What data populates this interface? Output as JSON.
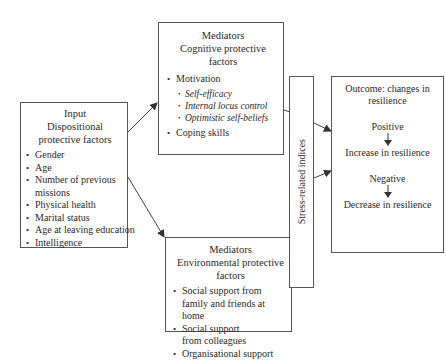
{
  "input": {
    "heading": "Input",
    "subheading": "Dispositional protective factors",
    "items": [
      "Gender",
      "Age",
      "Number of previous missions",
      "Physical health",
      "Marital status",
      "Age at leaving education",
      "Intelligence"
    ]
  },
  "cognitive": {
    "heading": "Mediators",
    "subheading": "Cognitive protective factors",
    "items": [
      "Motivation",
      "Coping skills"
    ],
    "motivation_subitems": [
      "Self-efficacy",
      "Internal locus control",
      "Optimistic self-beliefs"
    ]
  },
  "environmental": {
    "heading": "Mediators",
    "subheading": "Environmental protective factors",
    "items": [
      "Social support from family and friends at home",
      "Social support from colleagues",
      "Organisational support"
    ]
  },
  "stress": {
    "label": "Stress-related indices"
  },
  "outcome": {
    "heading": "Outcome: changes in resilience",
    "positive": "Positive",
    "positive_result": "Increase in resilience",
    "negative": "Negative",
    "negative_result": "Decrease in resilience"
  }
}
